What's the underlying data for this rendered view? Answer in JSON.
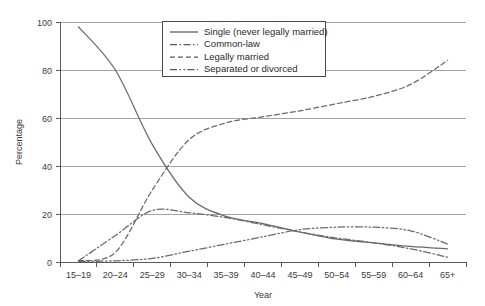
{
  "chart_data": {
    "type": "line",
    "title": "",
    "xlabel": "Year",
    "ylabel": "Percentage",
    "ylim": [
      0,
      100
    ],
    "yticks": [
      0,
      20,
      40,
      60,
      80,
      100
    ],
    "grid": true,
    "legend_position": "upper-center",
    "categories": [
      "15–19",
      "20–24",
      "25–29",
      "30–34",
      "35–39",
      "40–44",
      "45–49",
      "50–54",
      "55–59",
      "60–64",
      "65+"
    ],
    "series": [
      {
        "name": "Single (never legally married)",
        "style": "solid",
        "color": "#6a6a6a",
        "values": [
          98,
          80,
          49,
          27,
          19,
          16,
          12.5,
          9.5,
          8,
          6.5,
          5.5
        ]
      },
      {
        "name": "Common-law",
        "style": "dash-dot",
        "color": "#6a6a6a",
        "values": [
          0.5,
          11,
          21.5,
          20.5,
          18.5,
          15.5,
          12.5,
          10,
          8,
          5.5,
          2
        ]
      },
      {
        "name": "Legally married",
        "style": "dashed",
        "color": "#6a6a6a",
        "values": [
          0.5,
          4,
          30,
          51,
          58,
          60.5,
          63,
          66,
          69,
          74,
          84
        ]
      },
      {
        "name": "Separated or divorced",
        "style": "dash-dot-dot",
        "color": "#6a6a6a",
        "values": [
          0.2,
          0.5,
          1.5,
          4.5,
          7.5,
          10.5,
          13.5,
          14.5,
          14.5,
          13,
          7.5
        ]
      }
    ]
  },
  "axes": {
    "y_tick_labels": [
      "0",
      "20",
      "40",
      "60",
      "80",
      "100"
    ],
    "x_tick_labels": [
      "15–19",
      "20–24",
      "25–29",
      "30–34",
      "35–39",
      "40–44",
      "45–49",
      "50–54",
      "55–59",
      "60–64",
      "65+"
    ],
    "y_axis_title": "Percentage",
    "x_axis_title": "Year"
  },
  "legend": {
    "entries": [
      {
        "label": "Single (never legally married)",
        "style": "solid"
      },
      {
        "label": "Common-law",
        "style": "dash-dot"
      },
      {
        "label": "Legally married",
        "style": "dashed"
      },
      {
        "label": "Separated or divorced",
        "style": "dash-dot-dot"
      }
    ]
  }
}
